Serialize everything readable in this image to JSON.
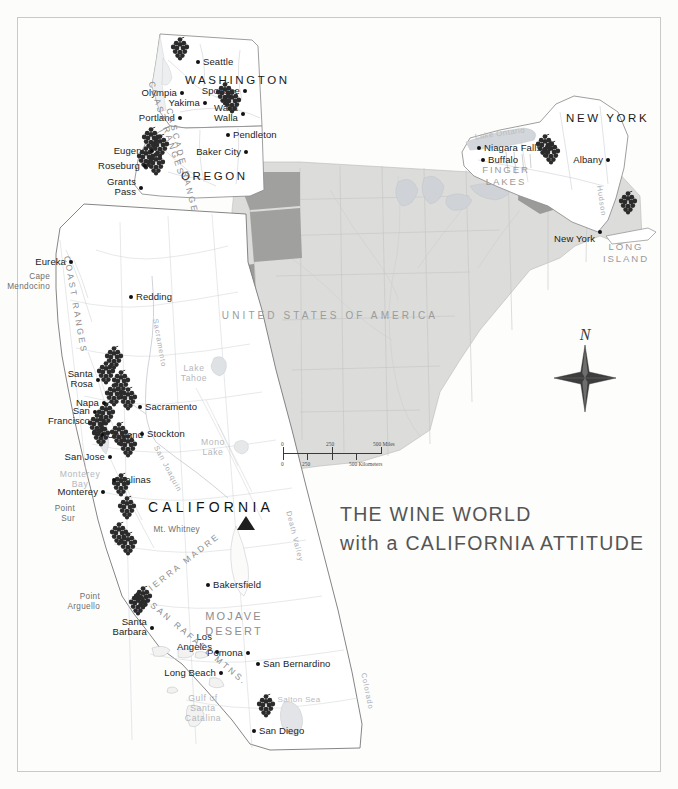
{
  "map": {
    "title_line1": "THE WINE WORLD",
    "title_line2": "with a CALIFORNIA ATTITUDE",
    "country_label": "UNITED STATES OF AMERICA",
    "compass_label": "N",
    "accent_color": "#2b2b2b",
    "highlight_state_color": "#9a9a9a",
    "base_state_color": "#d8d8d6",
    "states": [
      {
        "name": "WASHINGTON",
        "x": 185,
        "y": 74
      },
      {
        "name": "OREGON",
        "x": 181,
        "y": 170
      },
      {
        "name": "NEW YORK",
        "x": 566,
        "y": 112
      },
      {
        "name": "CALIFORNIA",
        "x": 148,
        "y": 500
      }
    ],
    "cities": [
      {
        "name": "Seattle",
        "x": 198,
        "y": 62,
        "dx": 5,
        "dy": -5,
        "align": "left"
      },
      {
        "name": "Olympia",
        "x": 182,
        "y": 93,
        "dx": -5,
        "dy": -5,
        "align": "right"
      },
      {
        "name": "Yakima",
        "x": 205,
        "y": 103,
        "dx": -5,
        "dy": -5,
        "align": "right"
      },
      {
        "name": "Spokane",
        "x": 245,
        "y": 91,
        "dx": -5,
        "dy": -5,
        "align": "right"
      },
      {
        "name": "Walla\nWalla",
        "x": 243,
        "y": 114,
        "dx": -5,
        "dy": -11,
        "align": "right"
      },
      {
        "name": "Portland",
        "x": 180,
        "y": 118,
        "dx": -5,
        "dy": -5,
        "align": "right"
      },
      {
        "name": "Pendleton",
        "x": 228,
        "y": 135,
        "dx": 5,
        "dy": -5,
        "align": "left"
      },
      {
        "name": "Baker City",
        "x": 246,
        "y": 152,
        "dx": -5,
        "dy": -5,
        "align": "right"
      },
      {
        "name": "Eugene",
        "x": 152,
        "y": 151,
        "dx": -5,
        "dy": -5,
        "align": "right"
      },
      {
        "name": "Roseburg",
        "x": 145,
        "y": 166,
        "dx": -5,
        "dy": -5,
        "align": "right"
      },
      {
        "name": "Grants\nPass",
        "x": 141,
        "y": 188,
        "dx": -5,
        "dy": -11,
        "align": "right"
      },
      {
        "name": "Niagara Falls",
        "x": 479,
        "y": 148,
        "dx": 5,
        "dy": -5,
        "align": "left"
      },
      {
        "name": "Buffalo",
        "x": 483,
        "y": 160,
        "dx": 5,
        "dy": -5,
        "align": "left"
      },
      {
        "name": "Albany",
        "x": 608,
        "y": 160,
        "dx": -5,
        "dy": -5,
        "align": "right"
      },
      {
        "name": "New York",
        "x": 600,
        "y": 232,
        "dx": -5,
        "dy": 2,
        "align": "right"
      },
      {
        "name": "Eureka",
        "x": 71,
        "y": 262,
        "dx": -5,
        "dy": -5,
        "align": "right"
      },
      {
        "name": "Redding",
        "x": 131,
        "y": 297,
        "dx": 5,
        "dy": -5,
        "align": "left"
      },
      {
        "name": "Santa\nRosa",
        "x": 98,
        "y": 380,
        "dx": -5,
        "dy": -11,
        "align": "right"
      },
      {
        "name": "Napa",
        "x": 104,
        "y": 403,
        "dx": -5,
        "dy": -5,
        "align": "right"
      },
      {
        "name": "San\nFrancisco",
        "x": 95,
        "y": 412,
        "dx": -5,
        "dy": -6,
        "align": "right"
      },
      {
        "name": "Sacramento",
        "x": 140,
        "y": 407,
        "dx": 5,
        "dy": -5,
        "align": "left"
      },
      {
        "name": "Oakland",
        "x": 102,
        "y": 435,
        "dx": 5,
        "dy": -5,
        "align": "left"
      },
      {
        "name": "Stockton",
        "x": 142,
        "y": 434,
        "dx": 5,
        "dy": -5,
        "align": "left"
      },
      {
        "name": "San Jose",
        "x": 110,
        "y": 457,
        "dx": -5,
        "dy": -5,
        "align": "right"
      },
      {
        "name": "Salinas",
        "x": 114,
        "y": 480,
        "dx": 5,
        "dy": -5,
        "align": "left"
      },
      {
        "name": "Monterey",
        "x": 103,
        "y": 492,
        "dx": -5,
        "dy": -5,
        "align": "right"
      },
      {
        "name": "Bakersfield",
        "x": 208,
        "y": 585,
        "dx": 5,
        "dy": -5,
        "align": "left"
      },
      {
        "name": "Santa\nBarbara",
        "x": 152,
        "y": 628,
        "dx": -5,
        "dy": -11,
        "align": "right"
      },
      {
        "name": "Los\nAngeles",
        "x": 217,
        "y": 652,
        "dx": -5,
        "dy": -20,
        "align": "right"
      },
      {
        "name": "Pomona",
        "x": 248,
        "y": 653,
        "dx": -5,
        "dy": -5,
        "align": "right"
      },
      {
        "name": "San Bernardino",
        "x": 258,
        "y": 664,
        "dx": 5,
        "dy": -5,
        "align": "left"
      },
      {
        "name": "Long Beach",
        "x": 221,
        "y": 673,
        "dx": -5,
        "dy": -5,
        "align": "right"
      },
      {
        "name": "San Diego",
        "x": 254,
        "y": 731,
        "dx": 5,
        "dy": -5,
        "align": "left"
      }
    ],
    "vineyards": [
      {
        "x": 180,
        "y": 48
      },
      {
        "x": 225,
        "y": 93
      },
      {
        "x": 232,
        "y": 101
      },
      {
        "x": 151,
        "y": 138
      },
      {
        "x": 160,
        "y": 145
      },
      {
        "x": 146,
        "y": 157
      },
      {
        "x": 156,
        "y": 163
      },
      {
        "x": 545,
        "y": 145
      },
      {
        "x": 551,
        "y": 152
      },
      {
        "x": 628,
        "y": 202
      },
      {
        "x": 114,
        "y": 357
      },
      {
        "x": 106,
        "y": 372
      },
      {
        "x": 121,
        "y": 381
      },
      {
        "x": 114,
        "y": 394
      },
      {
        "x": 128,
        "y": 398
      },
      {
        "x": 106,
        "y": 413
      },
      {
        "x": 97,
        "y": 424
      },
      {
        "x": 101,
        "y": 434
      },
      {
        "x": 119,
        "y": 433
      },
      {
        "x": 128,
        "y": 445
      },
      {
        "x": 121,
        "y": 484
      },
      {
        "x": 127,
        "y": 507
      },
      {
        "x": 119,
        "y": 533
      },
      {
        "x": 128,
        "y": 543
      },
      {
        "x": 143,
        "y": 597
      },
      {
        "x": 138,
        "y": 603
      },
      {
        "x": 266,
        "y": 705
      }
    ],
    "water_labels": [
      {
        "name": "Lake Ontario",
        "x": 500,
        "y": 130,
        "rot": -8
      },
      {
        "name": "Lake\nTahoe",
        "x": 194,
        "y": 364
      },
      {
        "name": "Mono\nLake",
        "x": 213,
        "y": 438
      },
      {
        "name": "Salton Sea",
        "x": 299,
        "y": 696
      },
      {
        "name": "Monterey\nBay",
        "x": 80,
        "y": 470
      },
      {
        "name": "Gulf of\nSanta\nCatalina",
        "x": 203,
        "y": 694
      }
    ],
    "region_labels": [
      {
        "name": "FINGER\nLAKES",
        "x": 506,
        "y": 164
      },
      {
        "name": "LONG\nISLAND",
        "x": 626,
        "y": 241
      }
    ],
    "geo_labels": [
      {
        "name": "Cape\nMendocino",
        "x": 50,
        "y": 272
      },
      {
        "name": "Point\nSur",
        "x": 75,
        "y": 504
      },
      {
        "name": "Point\nArguello",
        "x": 100,
        "y": 592
      },
      {
        "name": "Mt. Whitney",
        "x": 200,
        "y": 525
      }
    ],
    "desert_label": {
      "name": "MOJAVE\nDESERT",
      "x": 234,
      "y": 609
    },
    "ranges": [
      {
        "name": "COAST RANGES",
        "x": 156,
        "y": 80,
        "rot": 72
      },
      {
        "name": "CASCADE RANGE",
        "x": 174,
        "y": 107,
        "rot": 76
      },
      {
        "name": "COAST RANGES",
        "x": 72,
        "y": 255,
        "rot": 80
      },
      {
        "name": "SIERRA MADRE",
        "x": 140,
        "y": 590,
        "rot": -38
      },
      {
        "name": "SAN RAFAEL MTNS.",
        "x": 155,
        "y": 600,
        "rot": 40
      }
    ],
    "rivers": [
      {
        "name": "Sacramento",
        "x": 160,
        "y": 318,
        "rot": 80
      },
      {
        "name": "San Joaquin",
        "x": 160,
        "y": 444,
        "rot": 62
      },
      {
        "name": "Colorado",
        "x": 368,
        "y": 672,
        "rot": 78
      },
      {
        "name": "Death Valley",
        "x": 293,
        "y": 510,
        "rot": 76
      },
      {
        "name": "Hudson",
        "x": 604,
        "y": 185,
        "rot": 82
      }
    ],
    "scale": {
      "miles_0": "0",
      "miles_mid": "250",
      "miles_max": "500 Miles",
      "km_0": "0",
      "km_mid": "250",
      "km_max": "500 Kilometers"
    }
  }
}
